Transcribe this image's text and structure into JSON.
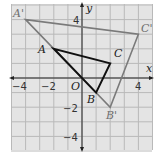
{
  "axes": {
    "x_label": "x",
    "y_label": "y",
    "origin_label": "O",
    "x_range": [
      -5,
      5
    ],
    "y_range": [
      -5,
      5
    ],
    "x_ticks": [
      {
        "value": -4,
        "label": "−4"
      },
      {
        "value": -2,
        "label": "−2"
      },
      {
        "value": 4,
        "label": "4"
      }
    ],
    "y_ticks": [
      {
        "value": 4,
        "label": "4"
      },
      {
        "value": -2,
        "label": "−2"
      },
      {
        "value": -4,
        "label": "−4"
      }
    ]
  },
  "triangles": {
    "original": {
      "color": "#111111",
      "vertices": [
        {
          "name": "A",
          "x": -2,
          "y": 2
        },
        {
          "name": "B",
          "x": 1,
          "y": -1
        },
        {
          "name": "C",
          "x": 2,
          "y": 1
        }
      ]
    },
    "image": {
      "color": "#7a7a7a",
      "vertices": [
        {
          "name": "A'",
          "x": -4,
          "y": 4
        },
        {
          "name": "B'",
          "x": 2,
          "y": -2
        },
        {
          "name": "C'",
          "x": 4,
          "y": 3
        }
      ]
    }
  },
  "colors": {
    "grid_bg": "#e4e4e4",
    "grid_line": "#b9b9b9",
    "axis": "#222222"
  }
}
